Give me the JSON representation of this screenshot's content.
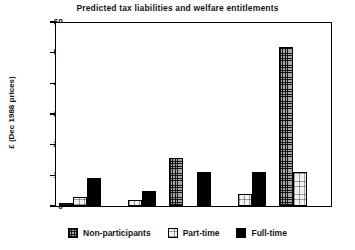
{
  "chart_data": {
    "type": "bar",
    "title": "Predicted tax liabilities and welfare entitlements",
    "xlabel": "",
    "ylabel": "£ (Dec 1988 prices)",
    "ylim": [
      0,
      60
    ],
    "yticks": [
      0,
      10,
      20,
      30,
      40,
      50,
      60
    ],
    "grid": false,
    "legend_position": "bottom",
    "categories": [
      "1",
      "2",
      "3",
      "4",
      "5"
    ],
    "series": [
      {
        "name": "Non-participants",
        "values": [
          1,
          0,
          15.5,
          0,
          52
        ]
      },
      {
        "name": "Part-time",
        "values": [
          3,
          2,
          0,
          4,
          11
        ]
      },
      {
        "name": "Full-time",
        "values": [
          9,
          5,
          11,
          11,
          0
        ]
      }
    ]
  },
  "legend": {
    "items": [
      {
        "label": "Non-participants",
        "swatch": "crosshatch-swatch"
      },
      {
        "label": "Part-time",
        "swatch": "light-swatch"
      },
      {
        "label": "Full-time",
        "swatch": "solid-black-swatch"
      }
    ]
  },
  "colors": {
    "axis": "#000000",
    "text": "#151515",
    "background": "#ffffff",
    "nonparticipants": "#a8a8a8",
    "parttime": "#f2f2f2",
    "fulltime": "#000000"
  }
}
